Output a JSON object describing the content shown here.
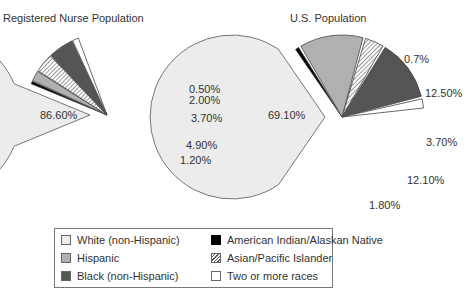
{
  "chart_data": [
    {
      "type": "pie",
      "title": "Registered Nurse Population",
      "slices": [
        {
          "label": "White (non-Hispanic)",
          "value": 86.6,
          "display": "86.60%",
          "exploded": false
        },
        {
          "label": "American Indian/Alaskan Native",
          "value": 0.5,
          "display": "0.50%",
          "exploded": true
        },
        {
          "label": "Hispanic",
          "value": 2.0,
          "display": "2.00%",
          "exploded": true
        },
        {
          "label": "Asian/Pacific Islander",
          "value": 3.7,
          "display": "3.70%",
          "exploded": true
        },
        {
          "label": "Black (non-Hispanic)",
          "value": 4.9,
          "display": "4.90%",
          "exploded": true
        },
        {
          "label": "Two or more races",
          "value": 1.2,
          "display": "1.20%",
          "exploded": true
        }
      ]
    },
    {
      "type": "pie",
      "title": "U.S. Population",
      "slices": [
        {
          "label": "White (non-Hispanic)",
          "value": 69.1,
          "display": "69.10%",
          "exploded": false
        },
        {
          "label": "American Indian/Alaskan Native",
          "value": 0.7,
          "display": "0.7%",
          "exploded": true
        },
        {
          "label": "Hispanic",
          "value": 12.5,
          "display": "12.50%",
          "exploded": true
        },
        {
          "label": "Asian/Pacific Islander",
          "value": 3.7,
          "display": "3.70%",
          "exploded": true
        },
        {
          "label": "Black (non-Hispanic)",
          "value": 12.1,
          "display": "12.10%",
          "exploded": true
        },
        {
          "label": "Two or more races",
          "value": 1.8,
          "display": "1.80%",
          "exploded": true
        }
      ]
    }
  ],
  "charts": {
    "left": {
      "title": "Registered Nurse Population",
      "labels": {
        "white": "86.60%",
        "native": "0.50%",
        "hispanic": "2.00%",
        "asian": "3.70%",
        "black": "4.90%",
        "two": "1.20%"
      }
    },
    "right": {
      "title": "U.S. Population",
      "labels": {
        "white": "69.10%",
        "native": "0.7%",
        "hispanic": "12.50%",
        "asian": "3.70%",
        "black": "12.10%",
        "two": "1.80%"
      }
    }
  },
  "legend": {
    "items": [
      {
        "label": "White (non-Hispanic)",
        "color": "#ececec"
      },
      {
        "label": "Hispanic",
        "color": "#b0b0b0"
      },
      {
        "label": "Black (non-Hispanic)",
        "color": "#555555"
      },
      {
        "label": "American Indian/Alaskan Native",
        "color": "#000000"
      },
      {
        "label": "Asian/Pacific Islander",
        "color": "hatched"
      },
      {
        "label": "Two or more races",
        "color": "#ffffff"
      }
    ]
  }
}
